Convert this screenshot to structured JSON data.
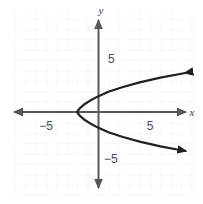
{
  "figure": {
    "name": "sideways-parabola-graph",
    "width": 203,
    "height": 204,
    "background_color": "#ffffff"
  },
  "axes": {
    "x_axis_label": "x",
    "y_axis_label": "y",
    "axis_color": "#58585a",
    "grid_color": "#f0f0f2",
    "grid_visible": true,
    "origin_px": {
      "x": 98,
      "y": 112
    },
    "pixels_per_unit": 10.4,
    "x_ticks": [
      {
        "label": "−5",
        "value": -5,
        "px_x": 46,
        "px_y": 126
      },
      {
        "label": "5",
        "value": 5,
        "px_x": 150,
        "px_y": 126
      }
    ],
    "y_ticks": [
      {
        "label": "5",
        "value": 5,
        "px_x": 108,
        "px_y": 62
      },
      {
        "label": "−5",
        "value": -5,
        "px_x": 104,
        "px_y": 162
      }
    ]
  },
  "chart_data": {
    "type": "line",
    "title": "",
    "xlabel": "x",
    "ylabel": "y",
    "xlim": [
      -8.3,
      8.7
    ],
    "ylim": [
      -8.1,
      9.1
    ],
    "grid": true,
    "legend": null,
    "annotations": [],
    "series": [
      {
        "name": "sideways-parabola",
        "equation": "x = y^2 / 3 - 2",
        "orientation": "opens-right",
        "vertex": [
          -2,
          0
        ],
        "color": "#231f20",
        "line_width": 2.2,
        "arrow_start": true,
        "arrow_end": true,
        "x": [
          8.4,
          6.0,
          4.0,
          2.4,
          1.0,
          0.0,
          -0.75,
          -1.3,
          -1.7,
          -1.925,
          -2.0,
          -1.925,
          -1.7,
          -1.3,
          -0.75,
          0.0,
          1.0,
          2.4,
          4.0,
          6.0,
          8.4
        ],
        "y": [
          3.75,
          3.3,
          2.85,
          2.4,
          1.95,
          1.5,
          1.1,
          0.75,
          0.4,
          0.15,
          0.0,
          -0.15,
          -0.4,
          -0.75,
          -1.1,
          -1.5,
          -1.95,
          -2.4,
          -2.85,
          -3.3,
          -3.75
        ]
      }
    ]
  }
}
